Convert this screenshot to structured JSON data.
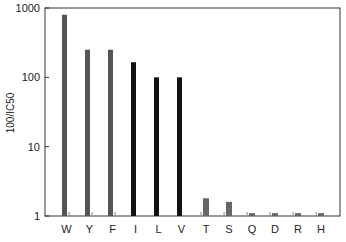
{
  "chart_data": {
    "type": "bar",
    "title": "",
    "xlabel": "",
    "ylabel": "100/IC50",
    "yscale": "log",
    "ylim": [
      1,
      1000
    ],
    "yticks": [
      1,
      10,
      100,
      1000
    ],
    "ytick_labels": [
      "1",
      "10",
      "100",
      "1000"
    ],
    "grid": false,
    "legend": null,
    "categories": [
      "W",
      "Y",
      "F",
      "I",
      "L",
      "V",
      "T",
      "S",
      "Q",
      "D",
      "R",
      "H"
    ],
    "series": [
      {
        "name": "main",
        "values": [
          800,
          250,
          250,
          165,
          100,
          100,
          1.8,
          1.6,
          1.1,
          1.1,
          1.1,
          1.1
        ],
        "colors": [
          "#555555",
          "#555555",
          "#555555",
          "#111111",
          "#111111",
          "#111111",
          "#666666",
          "#666666",
          "#666666",
          "#666666",
          "#666666",
          "#666666"
        ]
      },
      {
        "name": "secondary (minor ticks)",
        "values": [
          1.05,
          1.05,
          1.05,
          null,
          null,
          null,
          1.05,
          1.05,
          1.05,
          1.05,
          1.05,
          1.05
        ],
        "color": "#999999"
      }
    ]
  },
  "axis": {
    "ylabel": "100/IC50",
    "yticks": [
      "1",
      "10",
      "100",
      "1000"
    ]
  }
}
